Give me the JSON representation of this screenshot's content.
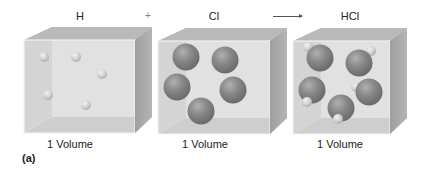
{
  "header": {
    "reactant1": "H",
    "operator_plus": "+",
    "reactant2": "Cl",
    "product": "HCl"
  },
  "boxes": [
    {
      "id": "h-box",
      "label": "1 Volume",
      "formula": "H",
      "atoms": [
        {
          "type": "H",
          "cx": 44,
          "cy": 57
        },
        {
          "type": "H",
          "cx": 76,
          "cy": 57
        },
        {
          "type": "H",
          "cx": 102,
          "cy": 74
        },
        {
          "type": "H",
          "cx": 48,
          "cy": 95
        },
        {
          "type": "H",
          "cx": 86,
          "cy": 105
        }
      ]
    },
    {
      "id": "cl-box",
      "label": "1 Volume",
      "formula": "Cl",
      "atoms": [
        {
          "type": "Cl",
          "cx": 186,
          "cy": 57
        },
        {
          "type": "Cl",
          "cx": 225,
          "cy": 60
        },
        {
          "type": "Cl",
          "cx": 177,
          "cy": 87
        },
        {
          "type": "Cl",
          "cx": 233,
          "cy": 90
        },
        {
          "type": "Cl",
          "cx": 201,
          "cy": 111
        }
      ]
    },
    {
      "id": "hcl-box",
      "label": "1 Volume",
      "formula": "HCl",
      "molecules": [
        {
          "cl": [
            320,
            58
          ],
          "h": [
            308,
            47
          ]
        },
        {
          "cl": [
            359,
            63
          ],
          "h": [
            371,
            51
          ]
        },
        {
          "cl": [
            312,
            90
          ],
          "h": [
            307,
            102
          ]
        },
        {
          "cl": [
            369,
            92
          ],
          "h": [
            356,
            87
          ]
        },
        {
          "cl": [
            341,
            108
          ],
          "h": [
            338,
            119
          ]
        }
      ]
    }
  ],
  "part_label": "(a)",
  "colors": {
    "background": "#ffffff",
    "box_front": "#d9d9d9",
    "box_back": "#e6e6e6",
    "box_top": "#b8b8b8",
    "box_side": "#a9a9a9",
    "box_floor": "#c4c4c4",
    "cl_atom": "#505050",
    "h_atom": "#c8c8c8"
  }
}
